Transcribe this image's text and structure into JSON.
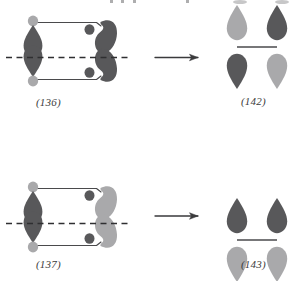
{
  "figure": {
    "kind": "orbital-correlation-diagram",
    "background_color": "#ffffff",
    "colors": {
      "dark_lobe": "#58585a",
      "light_lobe": "#a9a9ab",
      "bond_line": "#4a4a4c",
      "dashed_mirror": "#2f2f31",
      "arrow": "#3a3a3c",
      "label_text": "#3b3b3b"
    }
  },
  "rows": [
    {
      "id": "row-top",
      "reactant": {
        "label": "(136)",
        "left_fragment": {
          "top_cap_shade": "light",
          "upper_lobe_shade": "dark",
          "lower_lobe_shade": "dark",
          "bottom_cap_shade": "light"
        },
        "right_fragment": {
          "shape": "s-curve",
          "body_shade": "dark",
          "inner_dot_shade": "dark"
        },
        "mirror_plane": "dashed-horizontal",
        "symmetry": "A"
      },
      "arrow": {
        "glyph": "→",
        "direction": "right"
      },
      "product": {
        "label": "(142)",
        "left_orbital": {
          "top_shade": "light",
          "bottom_shade": "dark"
        },
        "right_orbital": {
          "top_shade": "dark",
          "bottom_shade": "light"
        },
        "symmetry": "antisymmetric"
      }
    },
    {
      "id": "row-bottom",
      "reactant": {
        "label": "(137)",
        "left_fragment": {
          "top_cap_shade": "light",
          "upper_lobe_shade": "dark",
          "lower_lobe_shade": "dark",
          "bottom_cap_shade": "light"
        },
        "right_fragment": {
          "shape": "s-curve",
          "body_shade": "light",
          "inner_dot_shade": "dark"
        },
        "mirror_plane": "dashed-horizontal",
        "symmetry": "S"
      },
      "arrow": {
        "glyph": "→",
        "direction": "right"
      },
      "product": {
        "label": "(143)",
        "left_orbital": {
          "top_shade": "dark",
          "bottom_shade": "light"
        },
        "right_orbital": {
          "top_shade": "dark",
          "bottom_shade": "light"
        },
        "symmetry": "symmetric"
      }
    }
  ],
  "labels": {
    "reactant_top": "(136)",
    "product_top": "(142)",
    "reactant_bottom": "(137)",
    "product_bottom": "(143)"
  }
}
